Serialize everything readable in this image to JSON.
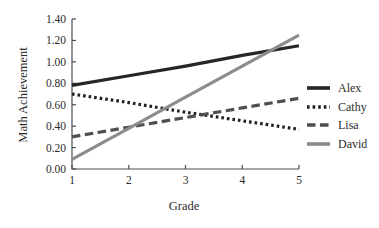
{
  "chart_data": {
    "type": "line",
    "title": "",
    "xlabel": "Grade",
    "ylabel": "Math Achievement",
    "x": [
      1,
      2,
      3,
      4,
      5
    ],
    "xlim": [
      1,
      5
    ],
    "ylim": [
      0,
      1.4
    ],
    "x_ticks": [
      "1",
      "2",
      "3",
      "4",
      "5"
    ],
    "y_ticks": [
      "0.00",
      "0.20",
      "0.40",
      "0.60",
      "0.80",
      "1.00",
      "1.20",
      "1.40"
    ],
    "grid": false,
    "legend_position": "right",
    "axis_color": "#4d4d4d",
    "series": [
      {
        "name": "Alex",
        "values": [
          0.78,
          0.87,
          0.96,
          1.06,
          1.15
        ],
        "color": "#262626",
        "dash": "solid"
      },
      {
        "name": "Cathy",
        "values": [
          0.7,
          0.62,
          0.53,
          0.45,
          0.37
        ],
        "color": "#1f1f1f",
        "dash": "dotted"
      },
      {
        "name": "Lisa",
        "values": [
          0.3,
          0.39,
          0.48,
          0.57,
          0.66
        ],
        "color": "#4f4f4f",
        "dash": "dashed"
      },
      {
        "name": "David",
        "values": [
          0.09,
          0.38,
          0.67,
          0.96,
          1.25
        ],
        "color": "#8c8c8c",
        "dash": "solid"
      }
    ]
  }
}
